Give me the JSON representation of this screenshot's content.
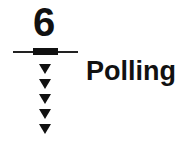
{
  "diagram": {
    "step_number": "6",
    "label": "Polling",
    "arrow_count": 5,
    "arrow_icon": "down-triangle-icon",
    "colors": {
      "foreground": "#111111",
      "background": "#ffffff"
    }
  }
}
